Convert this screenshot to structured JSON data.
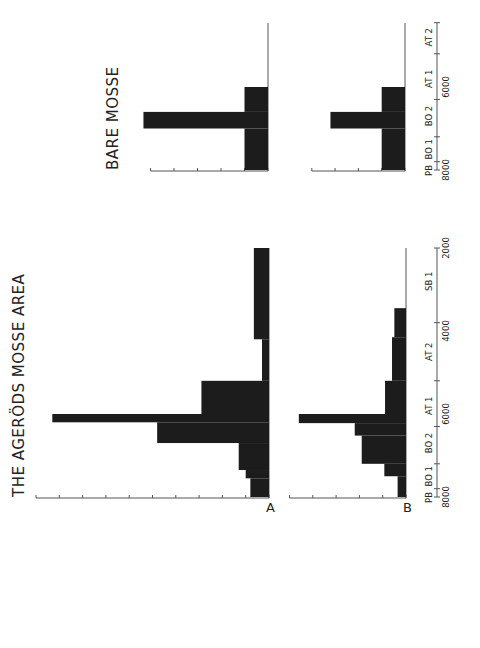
{
  "figure": {
    "title_left": "THE AGERÖDS MOSSE AREA",
    "title_right": "BARE MOSSE",
    "panel_labels": [
      "A",
      "B"
    ]
  },
  "colors": {
    "bar": "#1c1c1c",
    "axis": "#555555",
    "background": "#ffffff"
  },
  "chart_data": [
    {
      "type": "bar",
      "title": "THE AGERÖDS MOSSE AREA — A",
      "orientation": "histogram (step), rotated 90° CCW on page",
      "xlabel": "Years BP",
      "ylabel": "",
      "x_range": [
        8000,
        2000
      ],
      "ylim": [
        0,
        10
      ],
      "period_labels": [
        "PB",
        "BO 1",
        "BO 2",
        "AT 1",
        "AT 2",
        "SB 1"
      ],
      "year_ticks": [
        8000,
        6000,
        4000,
        2000
      ],
      "bins": [
        {
          "from": 8000,
          "to": 7550,
          "value": 0.8
        },
        {
          "from": 7550,
          "to": 7350,
          "value": 1.0
        },
        {
          "from": 7350,
          "to": 6700,
          "value": 1.3
        },
        {
          "from": 6700,
          "to": 6200,
          "value": 4.8
        },
        {
          "from": 6200,
          "to": 6000,
          "value": 9.3
        },
        {
          "from": 6000,
          "to": 5200,
          "value": 2.9
        },
        {
          "from": 5200,
          "to": 4200,
          "value": 0.3
        },
        {
          "from": 4200,
          "to": 2000,
          "value": 0.65
        }
      ]
    },
    {
      "type": "bar",
      "title": "THE AGERÖDS MOSSE AREA — B",
      "x_range": [
        8000,
        2000
      ],
      "ylim": [
        0,
        5
      ],
      "bins": [
        {
          "from": 8000,
          "to": 7500,
          "value": 0.36
        },
        {
          "from": 7500,
          "to": 7200,
          "value": 0.93
        },
        {
          "from": 7200,
          "to": 6520,
          "value": 1.9
        },
        {
          "from": 6520,
          "to": 6220,
          "value": 2.2
        },
        {
          "from": 6220,
          "to": 6000,
          "value": 4.6
        },
        {
          "from": 6000,
          "to": 5200,
          "value": 0.9
        },
        {
          "from": 5200,
          "to": 4150,
          "value": 0.6
        },
        {
          "from": 4150,
          "to": 3450,
          "value": 0.5
        }
      ]
    },
    {
      "type": "bar",
      "title": "BARE MOSSE — upper",
      "x_range": [
        8000,
        4500
      ],
      "ylim": [
        0,
        5
      ],
      "period_labels": [
        "PB",
        "BO 1",
        "BO 2",
        "AT 1",
        "AT 2"
      ],
      "year_ticks": [
        8000,
        6000
      ],
      "bins": [
        {
          "from": 8000,
          "to": 7000,
          "value": 1.0
        },
        {
          "from": 7000,
          "to": 6600,
          "value": 5.3
        },
        {
          "from": 6600,
          "to": 6000,
          "value": 1.0
        }
      ]
    },
    {
      "type": "bar",
      "title": "BARE MOSSE — lower",
      "x_range": [
        8000,
        4500
      ],
      "ylim": [
        0,
        4
      ],
      "bins": [
        {
          "from": 8000,
          "to": 7000,
          "value": 1.0
        },
        {
          "from": 7000,
          "to": 6600,
          "value": 3.2
        },
        {
          "from": 6600,
          "to": 6000,
          "value": 1.0
        }
      ]
    }
  ],
  "axes": {
    "agerods": {
      "periods": [
        {
          "label": "PB",
          "year": 8000
        },
        {
          "label": "BO 1",
          "year": 7500
        },
        {
          "label": "BO 2",
          "year": 6700
        },
        {
          "label": "AT 1",
          "year": 5800
        },
        {
          "label": "AT 2",
          "year": 4500
        },
        {
          "label": "SB 1",
          "year": 2800
        }
      ],
      "boundaries": [
        8000,
        7800,
        7200,
        6300,
        5200,
        3800,
        2000
      ],
      "years": [
        {
          "label": "8000",
          "year": 8000
        },
        {
          "label": "6000",
          "year": 6000
        },
        {
          "label": "4000",
          "year": 4000
        },
        {
          "label": "2000",
          "year": 2000
        }
      ]
    },
    "bare": {
      "periods": [
        {
          "label": "PB",
          "year": 8000
        },
        {
          "label": "BO 1",
          "year": 7500
        },
        {
          "label": "BO 2",
          "year": 6700
        },
        {
          "label": "AT 1",
          "year": 5800
        },
        {
          "label": "AT 2",
          "year": 4800
        }
      ],
      "boundaries": [
        8000,
        7800,
        7200,
        6300,
        5200,
        4450
      ],
      "years": [
        {
          "label": "8000",
          "year": 8000
        },
        {
          "label": "6000",
          "year": 6000
        }
      ]
    }
  }
}
